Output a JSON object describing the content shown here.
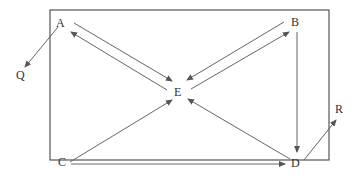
{
  "diagram": {
    "frame": {
      "x": 50,
      "y": 10,
      "width": 279,
      "height": 150
    },
    "nodes": [
      {
        "id": "A",
        "label": "A",
        "x": 62,
        "y": 26
      },
      {
        "id": "B",
        "label": "B",
        "x": 296,
        "y": 26
      },
      {
        "id": "C",
        "label": "C",
        "x": 63,
        "y": 163
      },
      {
        "id": "D",
        "label": "D",
        "x": 296,
        "y": 163
      },
      {
        "id": "E",
        "label": "E",
        "x": 178,
        "y": 93
      },
      {
        "id": "Q",
        "label": "Q",
        "x": 20,
        "y": 78
      },
      {
        "id": "R",
        "label": "R",
        "x": 338,
        "y": 112
      }
    ],
    "edges": [
      {
        "from": "A",
        "to": "E"
      },
      {
        "from": "E",
        "to": "A"
      },
      {
        "from": "B",
        "to": "E"
      },
      {
        "from": "E",
        "to": "B"
      },
      {
        "from": "C",
        "to": "E"
      },
      {
        "from": "D",
        "to": "E"
      },
      {
        "from": "B",
        "to": "D"
      },
      {
        "from": "C",
        "to": "D"
      },
      {
        "from": "A",
        "to": "Q"
      },
      {
        "from": "D",
        "to": "R"
      }
    ]
  }
}
